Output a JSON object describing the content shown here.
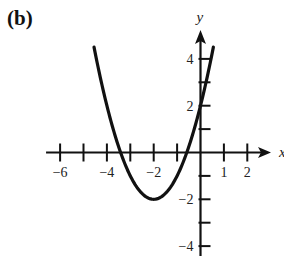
{
  "panel": {
    "label": "(b)"
  },
  "chart_data": {
    "type": "line",
    "title": "",
    "xlabel": "x",
    "ylabel": "y",
    "xlim": [
      -6.6,
      3.2
    ],
    "ylim": [
      -4.5,
      5.2
    ],
    "grid": false,
    "legend": null,
    "x_ticks": [
      -6,
      -5,
      -4,
      -3,
      -2,
      -1,
      1,
      2
    ],
    "x_tick_labels": [
      {
        "value": -6,
        "label": "−6"
      },
      {
        "value": -4,
        "label": "−4"
      },
      {
        "value": -2,
        "label": "−2"
      },
      {
        "value": 1,
        "label": "1"
      },
      {
        "value": 2,
        "label": "2"
      }
    ],
    "y_ticks": [
      -4,
      -3,
      -2,
      -1,
      1,
      2,
      3,
      4
    ],
    "y_tick_labels": [
      {
        "value": 4,
        "label": "4"
      },
      {
        "value": 2,
        "label": "2"
      },
      {
        "value": -2,
        "label": "−2"
      },
      {
        "value": -4,
        "label": "−4"
      }
    ],
    "series": [
      {
        "name": "y = x^2 + 4x + 2",
        "equation": "y = (x + 2)^2 - 2",
        "vertex": [
          -2,
          -2
        ],
        "x_intercepts": [
          -3.41,
          -0.59
        ],
        "y_intercept": 2,
        "x": [
          -4.55,
          -4.5,
          -4,
          -3.5,
          -3,
          -2.5,
          -2,
          -1.5,
          -1,
          -0.5,
          0,
          0.5,
          0.55
        ],
        "values": [
          4.5,
          4.25,
          2,
          0.25,
          -1,
          -1.75,
          -2,
          -1.75,
          -1,
          0.25,
          2,
          4.25,
          4.5
        ]
      }
    ]
  }
}
